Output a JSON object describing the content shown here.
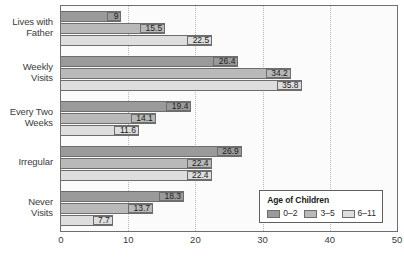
{
  "chart_data": {
    "type": "bar",
    "orientation": "horizontal",
    "title": "",
    "xlabel": "",
    "ylabel": "",
    "xlim": [
      0,
      50
    ],
    "xticks": [
      0,
      10,
      20,
      30,
      40,
      50
    ],
    "grid": true,
    "grid_axis": "x",
    "grid_style": "dotted",
    "legend_position": "lower-right-inside",
    "categories": [
      "Lives with Father",
      "Weekly Visits",
      "Every Two Weeks",
      "Irregular",
      "Never Visits"
    ],
    "category_lines": [
      [
        "Lives with",
        "Father"
      ],
      [
        "Weekly",
        "Visits"
      ],
      [
        "Every Two",
        "Weeks"
      ],
      [
        "Irregular"
      ],
      [
        "Never",
        "Visits"
      ]
    ],
    "series": [
      {
        "name": "0–2",
        "color": "#9a9a9a",
        "values": [
          9,
          26.4,
          19.4,
          26.9,
          18.3
        ]
      },
      {
        "name": "3–5",
        "color": "#b9b9b9",
        "values": [
          15.5,
          34.2,
          14.1,
          22.4,
          13.7
        ]
      },
      {
        "name": "6–11",
        "color": "#dedede",
        "values": [
          22.5,
          35.8,
          11.6,
          22.4,
          7.7
        ]
      }
    ],
    "data_labels": [
      [
        "9",
        "15.5",
        "22.5"
      ],
      [
        "26.4",
        "34.2",
        "35.8"
      ],
      [
        "19.4",
        "14.1",
        "11.6"
      ],
      [
        "26.9",
        "22.4",
        "22.4"
      ],
      [
        "18.3",
        "13.7",
        "7.7"
      ]
    ]
  },
  "legend": {
    "title": "Age of Children",
    "items": [
      {
        "label": "0–2"
      },
      {
        "label": "3–5"
      },
      {
        "label": "6–11"
      }
    ]
  },
  "axis": {
    "x_tick_labels": [
      "0",
      "10",
      "20",
      "30",
      "40",
      "50"
    ]
  },
  "colors": {
    "series_0": "#9a9a9a",
    "series_1": "#b9b9b9",
    "series_2": "#dedede",
    "plot_background": "#fbfbfb",
    "frame": "#6f6f6f",
    "text": "#3b3b3b"
  }
}
